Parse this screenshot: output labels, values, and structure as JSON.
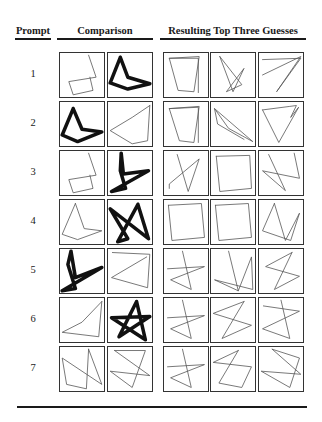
{
  "figure": {
    "headers": {
      "prompt": "Prompt",
      "comparison": "Comparison",
      "guesses": "Resulting Top Three Guesses"
    },
    "colors": {
      "ink": "#1a1a1a",
      "thin_stroke": "#555555",
      "bold_stroke": "#111111"
    },
    "rows": [
      {
        "label": "1",
        "comparison": [
          {
            "bold": false,
            "points": "65,5 82,55 20,65 30,95 75,85 68,55"
          },
          {
            "bold": true,
            "points": "28,10 45,55 95,70 45,82 5,68 28,10"
          }
        ],
        "guesses": [
          {
            "points": "12,12 80,8 68,88 32,85 12,12 78,12 78,90"
          },
          {
            "points": "20,8 70,72 35,88 75,35 50,88 20,8"
          },
          {
            "points": "8,15 95,12 40,88 95,8 8,50"
          }
        ]
      },
      {
        "label": "2",
        "comparison": [
          {
            "bold": true,
            "points": "30,15 50,62 95,68 40,90 5,75 30,15"
          },
          {
            "bold": false,
            "points": "95,8 90,88 55,95 5,65 55,35 95,8"
          }
        ],
        "guesses": [
          {
            "points": "12,15 80,10 68,92 35,88 12,15 78,12 78,92"
          },
          {
            "points": "8,15 95,90 40,60 8,15 15,50 75,85"
          },
          {
            "points": "8,18 70,10 85,8 72,35 90,12 45,92 8,18"
          }
        ]
      },
      {
        "label": "3",
        "comparison": [
          {
            "bold": false,
            "points": "65,5 82,55 20,65 30,95 75,85 68,55"
          },
          {
            "bold": true,
            "points": "30,5 35,52 92,45 8,92 40,85 28,45 30,5"
          }
        ],
        "guesses": [
          {
            "points": "30,8 55,92 80,18 12,75 12,85"
          },
          {
            "points": "12,12 88,10 92,85 20,92 12,12"
          },
          {
            "points": "22,8 60,90 8,45 92,62 80,5"
          }
        ]
      },
      {
        "label": "4",
        "comparison": [
          {
            "bold": false,
            "points": "35,8 55,65 95,70 40,90 5,78 35,8"
          },
          {
            "bold": true,
            "points": "68,10 92,88 5,20 45,88 22,95 68,10"
          }
        ],
        "guesses": [
          {
            "points": "10,12 85,8 92,85 18,92 10,12"
          },
          {
            "points": "10,12 85,8 92,85 18,92 10,12"
          },
          {
            "points": "35,8 60,92 92,30 72,92 8,70 35,8"
          }
        ]
      },
      {
        "label": "5",
        "comparison": [
          {
            "bold": true,
            "points": "25,5 35,65 95,42 5,95 35,90 18,35 25,5"
          },
          {
            "bold": false,
            "points": "10,8 95,12 90,88 8,65 88,18"
          }
        ],
        "guesses": [
          {
            "points": "42,5 62,92 15,70 92,40 8,45"
          },
          {
            "points": "40,5 62,95 8,70 95,92 92,18 62,95"
          },
          {
            "points": "75,8 15,40 92,62 35,92 75,8"
          }
        ]
      },
      {
        "label": "6",
        "comparison": [
          {
            "bold": false,
            "points": "95,8 88,88 5,78 50,55 95,8"
          },
          {
            "bold": true,
            "points": "65,8 85,95 8,45 95,42 25,88 65,8"
          }
        ],
        "guesses": [
          {
            "points": "42,5 62,92 15,70 92,40 8,45"
          },
          {
            "points": "75,8 5,35 92,62 25,92 75,8"
          },
          {
            "points": "50,5 70,92 8,70 92,30 10,18"
          }
        ]
      },
      {
        "label": "7",
        "comparison": [
          {
            "bold": false,
            "points": "65,5 95,85 5,25 15,85 60,95 65,5"
          },
          {
            "bold": false,
            "points": "15,8 85,8 55,92 5,55 95,65 15,8"
          }
        ],
        "guesses": [
          {
            "points": "42,5 62,92 15,70 92,40 8,45"
          },
          {
            "points": "62,8 5,35 92,45 70,92 18,82 62,8"
          },
          {
            "points": "30,5 92,25 70,92 5,55 95,62 30,5"
          }
        ]
      }
    ]
  }
}
